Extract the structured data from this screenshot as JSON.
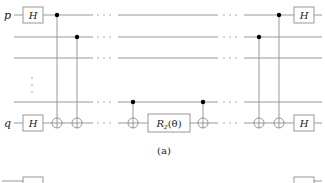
{
  "figure": {
    "caption": "(a)",
    "qubit_labels": {
      "top": "p",
      "bottom": "q"
    },
    "gates": {
      "hadamard": "H",
      "rotation": "R",
      "rotation_sub": "z",
      "rotation_arg": "(θ)"
    },
    "ellipsis": "⋯",
    "vertical_ellipsis": "⋮",
    "wire_color": "#8c8c8c",
    "control_color": "#000000"
  }
}
